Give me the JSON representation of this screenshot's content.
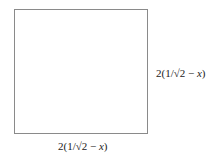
{
  "diagram": {
    "shape": "square",
    "border_color": "#8a8a8a",
    "side_labels": {
      "right": {
        "prefix": "2(1/√2 − ",
        "variable": "x",
        "suffix": ")"
      },
      "bottom": {
        "prefix": "2(1/√2 − ",
        "variable": "x",
        "suffix": ")"
      }
    }
  }
}
